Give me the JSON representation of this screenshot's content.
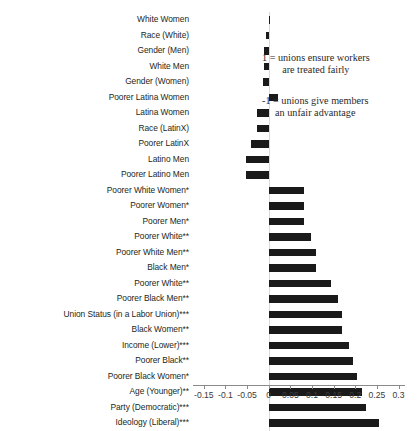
{
  "chart_data": {
    "type": "bar",
    "orientation": "horizontal",
    "title": "",
    "xlabel": "",
    "ylabel": "",
    "xlim": [
      -0.175,
      0.315
    ],
    "grid": false,
    "legend": "none",
    "zero_reference": 0,
    "categories": [
      "White Women",
      "Race (White)",
      "Gender (Men)",
      "White Men",
      "Gender (Women)",
      "Poorer Latina Women",
      "Latina Women",
      "Race (LatinX)",
      "Poorer LatinX",
      "Latino Men",
      "Poorer Latino Men",
      "Poorer White Women*",
      "Poorer Women*",
      "Poorer Men*",
      "Poorer White**",
      "Poorer White Men**",
      "Black Men*",
      "Poorer White**",
      "Poorer Black Men**",
      "Union Status (in a Labor Union)***",
      "Black Women**",
      "Income (Lower)***",
      "Poorer Black**",
      "Poorer Black Women*",
      "Age (Younger)**",
      "Party (Democratic)***",
      "Ideology (Liberal)***"
    ],
    "values": [
      0.004,
      -0.006,
      -0.011,
      -0.012,
      -0.014,
      0.021,
      -0.026,
      -0.027,
      -0.042,
      -0.053,
      -0.053,
      0.081,
      0.081,
      0.081,
      0.097,
      0.11,
      0.11,
      0.145,
      0.16,
      0.17,
      0.17,
      0.186,
      0.195,
      0.204,
      0.216,
      0.225,
      0.256
    ],
    "xticks": [
      -0.15,
      -0.1,
      -0.05,
      0,
      0.05,
      0.1,
      0.15,
      0.2,
      0.25,
      0.3
    ],
    "xticklabels": [
      "-0.15",
      "-0.1",
      "-0.05",
      "0",
      "0.05",
      "0.1",
      "0.15",
      "0.2",
      "0.25",
      "0.3"
    ],
    "annotations": [
      {
        "id": "positive",
        "line1": "1 = unions ensure workers",
        "line2": "are treated fairly"
      },
      {
        "id": "negative",
        "line1": "-1 = unions give members",
        "line2": "an unfair advantage"
      }
    ],
    "bar_color": "#1a1a1a"
  }
}
